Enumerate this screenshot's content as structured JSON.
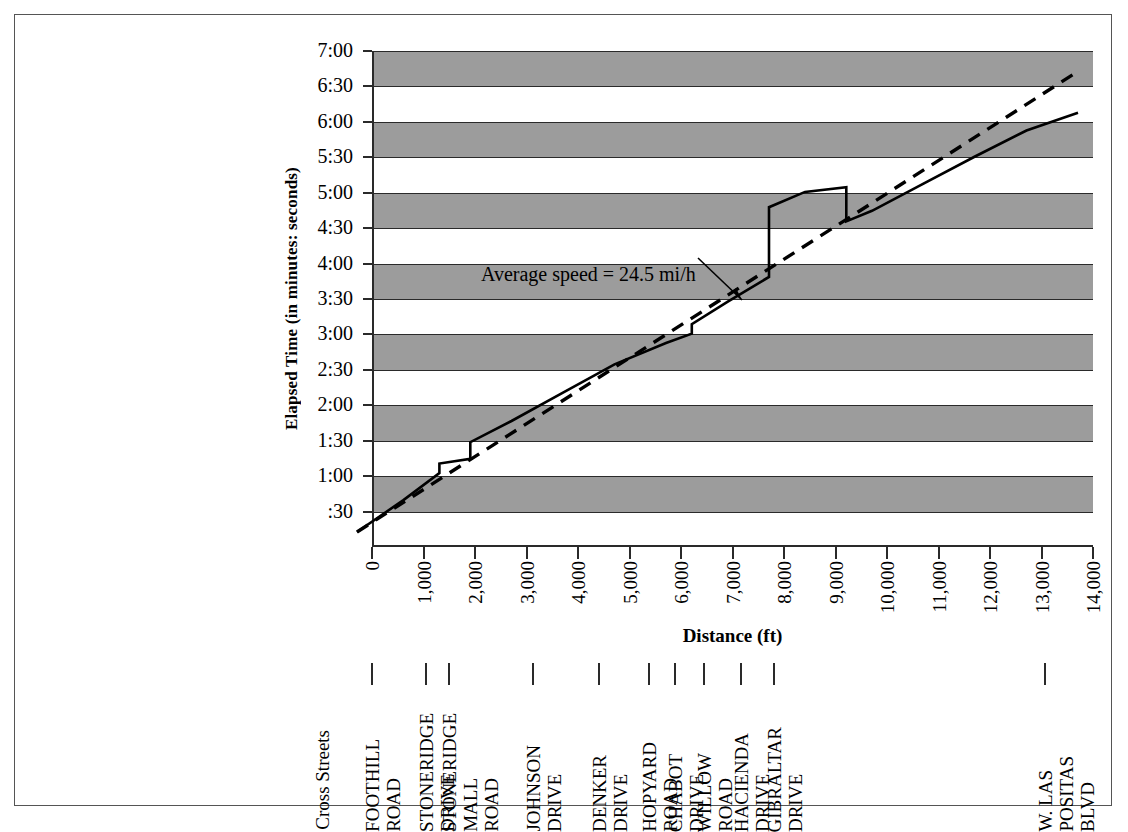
{
  "chart_data": {
    "type": "line",
    "title": "",
    "xlabel": "Distance (ft)",
    "ylabel": "Elapsed Time (in minutes: seconds)",
    "xlim": [
      0,
      14000
    ],
    "ylim_seconds": [
      0,
      420
    ],
    "grid": true,
    "banded_background": true,
    "band_color": "#9c9c9c",
    "y_tick_labels": [
      "7:00",
      "6:30",
      "6:00",
      "5:30",
      "5:00",
      "4:30",
      "4:00",
      "3:30",
      "3:00",
      "2:30",
      "2:00",
      "1:30",
      "1:00",
      ":30"
    ],
    "y_tick_seconds": [
      420,
      390,
      360,
      330,
      300,
      270,
      240,
      210,
      180,
      150,
      120,
      90,
      60,
      30
    ],
    "x_tick_labels": [
      "0",
      "1,000",
      "2,000",
      "3,000",
      "4,000",
      "5,000",
      "6,000",
      "7,000",
      "8,000",
      "9,000",
      "10,000",
      "11,000",
      "12,000",
      "13,000",
      "14,000"
    ],
    "x_tick_values": [
      0,
      1000,
      2000,
      3000,
      4000,
      5000,
      6000,
      7000,
      8000,
      9000,
      10000,
      11000,
      12000,
      13000,
      14000
    ],
    "annotations": [
      {
        "text": "Average speed = 24.5 mi/h",
        "points_to_series": "average-speed-dashed"
      }
    ],
    "series": [
      {
        "name": "average-speed-dashed",
        "style": "dashed",
        "color": "#000000",
        "points": [
          [
            0,
            0
          ],
          [
            14000,
            390
          ]
        ]
      },
      {
        "name": "observed-travel-time",
        "style": "solid",
        "color": "#000000",
        "points": [
          [
            0,
            0
          ],
          [
            900,
            27
          ],
          [
            1600,
            50
          ],
          [
            1600,
            58
          ],
          [
            2200,
            62
          ],
          [
            2200,
            76
          ],
          [
            3000,
            94
          ],
          [
            4000,
            118
          ],
          [
            5000,
            142
          ],
          [
            6000,
            160
          ],
          [
            6500,
            168
          ],
          [
            6500,
            176
          ],
          [
            7200,
            195
          ],
          [
            8000,
            216
          ],
          [
            8000,
            275
          ],
          [
            8700,
            288
          ],
          [
            9500,
            292
          ],
          [
            9500,
            263
          ],
          [
            10000,
            272
          ],
          [
            11000,
            295
          ],
          [
            12000,
            318
          ],
          [
            13000,
            340
          ],
          [
            14000,
            355
          ]
        ]
      }
    ]
  },
  "axis": {
    "y_title": "Elapsed Time (in minutes: seconds)",
    "x_title": "Distance (ft)"
  },
  "annotation": {
    "average_speed": "Average speed = 24.5 mi/h"
  },
  "cross_streets": {
    "label": "Cross Streets",
    "items": [
      {
        "lines": [
          "FOOTHILL",
          "ROAD"
        ],
        "distance_ft": -100
      },
      {
        "lines": [
          "STONERIDGE",
          "DRIVE"
        ],
        "distance_ft": 1050
      },
      {
        "lines": [
          "STONERIDGE",
          "MALL",
          "ROAD"
        ],
        "distance_ft": 1500
      },
      {
        "lines": [
          "JOHNSON",
          "DRIVE"
        ],
        "distance_ft": 3130
      },
      {
        "lines": [
          "DENKER",
          "DRIVE"
        ],
        "distance_ft": 4400
      },
      {
        "lines": [
          "HOPYARD",
          "ROAD"
        ],
        "distance_ft": 5370
      },
      {
        "lines": [
          "CHABOT",
          "DRIVE"
        ],
        "distance_ft": 5880
      },
      {
        "lines": [
          "WILLOW",
          "ROAD"
        ],
        "distance_ft": 6440
      },
      {
        "lines": [
          "HACIENDA",
          "DRIVE"
        ],
        "distance_ft": 7160
      },
      {
        "lines": [
          "GIBRALTAR",
          "DRIVE"
        ],
        "distance_ft": 7800
      },
      {
        "lines": [
          "W. LAS",
          "POSITAS",
          "BLVD"
        ],
        "distance_ft": 13060
      }
    ]
  }
}
